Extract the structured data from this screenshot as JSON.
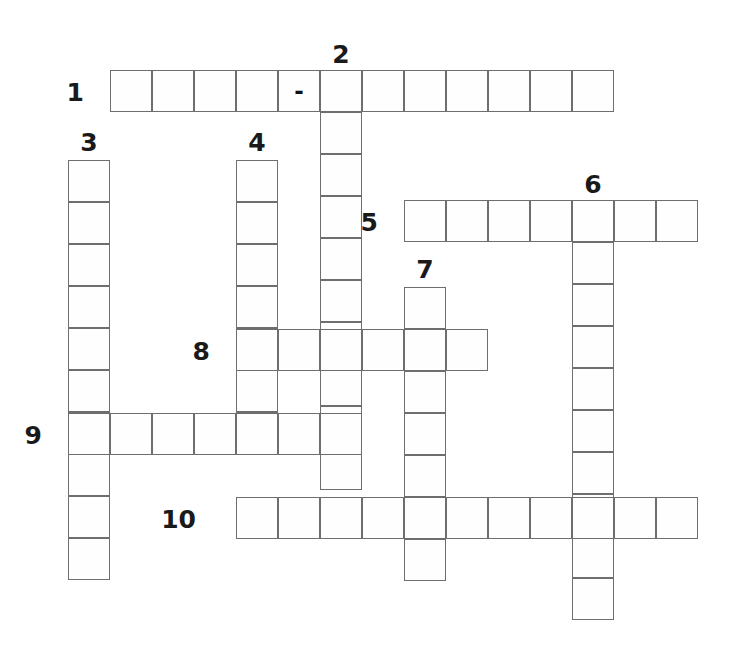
{
  "puzzle": {
    "type": "crossword-grid",
    "title": "",
    "cell_size": 42,
    "grid_color": "#6e6e6e",
    "cell_fill": "#fefefe",
    "background": "#ffffff",
    "number_color": "#1a1a1a",
    "entries": [
      {
        "number": "1",
        "direction": "across",
        "length": 12,
        "start_x": 110,
        "start_y": 70,
        "label_x": 84,
        "label_y": 80,
        "label_anchor": "left",
        "letters": {
          "4": "-"
        }
      },
      {
        "number": "2",
        "direction": "down",
        "length": 10,
        "start_x": 320,
        "start_y": 70,
        "label_x": 320,
        "label_y": 42,
        "label_anchor": "top",
        "letters": {}
      },
      {
        "number": "3",
        "direction": "down",
        "length": 10,
        "start_x": 68,
        "start_y": 160,
        "label_x": 68,
        "label_y": 130,
        "label_anchor": "top",
        "letters": {}
      },
      {
        "number": "4",
        "direction": "down",
        "length": 7,
        "start_x": 236,
        "start_y": 160,
        "label_x": 236,
        "label_y": 130,
        "label_anchor": "top",
        "letters": {}
      },
      {
        "number": "5",
        "direction": "across",
        "length": 7,
        "start_x": 404,
        "start_y": 200,
        "label_x": 378,
        "label_y": 210,
        "label_anchor": "left",
        "letters": {}
      },
      {
        "number": "6",
        "direction": "down",
        "length": 10,
        "start_x": 572,
        "start_y": 200,
        "label_x": 572,
        "label_y": 172,
        "label_anchor": "top",
        "letters": {}
      },
      {
        "number": "7",
        "direction": "down",
        "length": 7,
        "start_x": 404,
        "start_y": 287,
        "label_x": 404,
        "label_y": 257,
        "label_anchor": "top",
        "letters": {}
      },
      {
        "number": "8",
        "direction": "across",
        "length": 6,
        "start_x": 236,
        "start_y": 329,
        "label_x": 210,
        "label_y": 339,
        "label_anchor": "left",
        "letters": {}
      },
      {
        "number": "9",
        "direction": "across",
        "length": 7,
        "start_x": 68,
        "start_y": 413,
        "label_x": 42,
        "label_y": 423,
        "label_anchor": "left",
        "letters": {}
      },
      {
        "number": "10",
        "direction": "across",
        "length": 11,
        "start_x": 236,
        "start_y": 497,
        "label_x": 196,
        "label_y": 507,
        "label_anchor": "left",
        "letters": {}
      }
    ]
  }
}
